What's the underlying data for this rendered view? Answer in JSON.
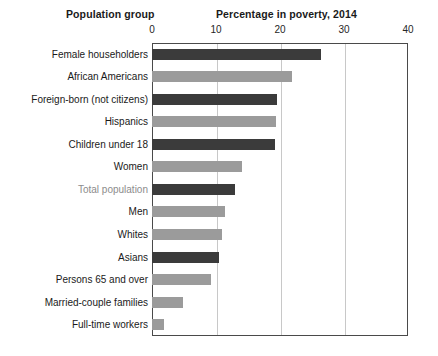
{
  "headers": {
    "group": "Population group",
    "value": "Percentage in poverty, 2014"
  },
  "colors": {
    "bar_dark": "#3b3b3b",
    "bar_light": "#9b9b9b",
    "grid": "#c8c8c8",
    "frame": "#4a4a4a",
    "text": "#1a1a1a",
    "text_muted": "#8c8c8c"
  },
  "chart_data": {
    "type": "bar",
    "orientation": "horizontal",
    "title": "Percentage in poverty, 2014",
    "xlabel": "Percentage in poverty, 2014",
    "ylabel": "Population group",
    "xlim": [
      0,
      40
    ],
    "xticks": [
      0,
      10,
      20,
      30,
      40
    ],
    "xtick_labels": [
      "0",
      "10",
      "20",
      "30",
      "40"
    ],
    "grid": true,
    "legend": null,
    "categories": [
      "Female householders",
      "African Americans",
      "Foreign-born (not citizens)",
      "Hispanics",
      "Children under 18",
      "Women",
      "Total population",
      "Men",
      "Whites",
      "Asians",
      "Persons 65 and over",
      "Married-couple families",
      "Full-time workers"
    ],
    "values": [
      26.4,
      21.8,
      19.6,
      19.4,
      19.2,
      14.0,
      13.0,
      11.4,
      11.0,
      10.4,
      9.2,
      4.8,
      1.9
    ],
    "bar_styles": [
      "dark",
      "light",
      "dark",
      "light",
      "dark",
      "light",
      "dark",
      "light",
      "light",
      "dark",
      "light",
      "light",
      "light"
    ],
    "highlight_category": "Total population"
  }
}
